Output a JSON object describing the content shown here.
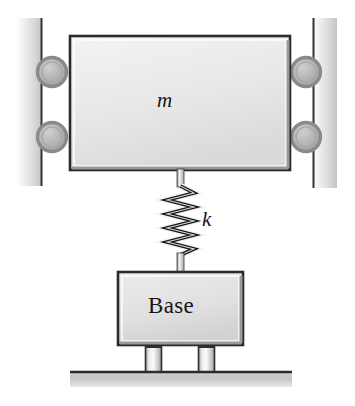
{
  "figure": {
    "kind": "mechanical-schematic",
    "background_color": "#ffffff"
  },
  "labels": {
    "mass": "m",
    "stiffness": "k",
    "base": "Base"
  },
  "colors": {
    "outline": "#1a1a1a",
    "block_fill_light": "#f0f0f0",
    "block_fill_dark": "#d2d2d2",
    "rail_fill_light": "#f4f4f4",
    "rail_fill_dark": "#c9c9c9",
    "roller_ring": "#8f8f8f",
    "roller_fill": "#b2b2b2",
    "leg_light": "#fafafa",
    "leg_dark": "#9a9a9a",
    "ground_fill": "#c6c6c6",
    "spring_stroke": "#1a1a1a",
    "rod_fill": "#e6e6e6"
  },
  "components": {
    "mass_block": {
      "name": "mass",
      "label": "m",
      "x": 70,
      "y": 36,
      "width": 220,
      "height": 134
    },
    "base_block": {
      "name": "base",
      "label": "Base",
      "x": 118,
      "y": 272,
      "width": 125,
      "height": 73
    },
    "spring": {
      "name": "spring",
      "label": "k",
      "coils": 5,
      "top_y": 185,
      "bottom_y": 255,
      "center_x": 181,
      "amplitude": 13
    },
    "rails": [
      {
        "side": "left",
        "x": 18,
        "y": 18,
        "width": 24,
        "height": 168
      },
      {
        "side": "right",
        "x": 313,
        "y": 18,
        "width": 24,
        "height": 170
      }
    ],
    "rollers": [
      {
        "position": "left-upper",
        "cx": 52,
        "cy": 72,
        "r": 15
      },
      {
        "position": "left-lower",
        "cx": 52,
        "cy": 137,
        "r": 15
      },
      {
        "position": "right-upper",
        "cx": 306,
        "cy": 72,
        "r": 15
      },
      {
        "position": "right-lower",
        "cx": 306,
        "cy": 137,
        "r": 15
      }
    ],
    "legs": [
      {
        "position": "left",
        "x": 145,
        "y": 346,
        "width": 17,
        "height": 26
      },
      {
        "position": "right",
        "x": 198,
        "y": 346,
        "width": 17,
        "height": 26
      }
    ],
    "ground": {
      "x": 70,
      "y": 371,
      "width": 222,
      "height": 16
    },
    "rods": [
      {
        "name": "upper-rod",
        "x": 177,
        "y": 170,
        "width": 7,
        "height": 17
      },
      {
        "name": "lower-rod",
        "x": 177,
        "y": 253,
        "width": 7,
        "height": 21
      }
    ]
  }
}
